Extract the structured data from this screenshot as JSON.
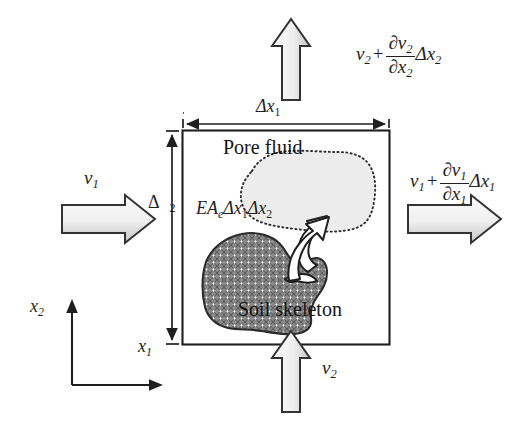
{
  "figure": {
    "name": "soil-rev-mass-balance-diagram",
    "background_color": "#ffffff",
    "line_color": "#1f1f1f"
  },
  "control_volume": {
    "label_pore_fluid": "Pore fluid",
    "label_soil_skeleton": "Soil skeleton",
    "source_term": {
      "prefix_E": "E",
      "prefix_A": "A",
      "subscript_e": "e",
      "delta1": "Δx",
      "sub1": "1",
      "delta2": "Δx",
      "sub2": "2"
    },
    "pore_fluid_fill": "#ececec",
    "pore_fluid_outline": "#2b2b2b",
    "soil_skeleton_fill": "#8c8c8c",
    "soil_skeleton_outline": "#2b2b2b",
    "box_outline": "#1f1f1f"
  },
  "dimensions": {
    "horizontal": {
      "delta": "Δx",
      "sub": "1"
    },
    "vertical": {
      "delta": "Δ",
      "sub": "2"
    }
  },
  "flux_labels": {
    "inflow_x1": {
      "v": "v",
      "sub": "1"
    },
    "inflow_x2": {
      "v": "v",
      "sub": "2"
    },
    "outflow_x1": {
      "v": "v",
      "sub": "1",
      "plus": "+",
      "num_d": "∂",
      "num_v": "v",
      "num_sub": "1",
      "den_d": "∂",
      "den_x": "x",
      "den_sub": "1",
      "tail_delta": "Δx",
      "tail_sub": "1"
    },
    "outflow_x2": {
      "v": "v",
      "sub": "2",
      "plus": "+",
      "num_d": "∂",
      "num_v": "v",
      "num_sub": "2",
      "den_d": "∂",
      "den_x": "x",
      "den_sub": "2",
      "tail_delta": "Δx",
      "tail_sub": "2"
    }
  },
  "axes": {
    "vertical_label": {
      "x": "x",
      "sub": "2"
    },
    "horizontal_label": {
      "x": "x",
      "sub": "1"
    }
  },
  "arrows": {
    "block_fill_light": "#f2f2f2",
    "block_fill_dark": "#c9c9c9",
    "block_outline": "#333333",
    "transfer_arrow_fill": "#ffffff",
    "transfer_arrow_outline": "#1f1f1f"
  }
}
